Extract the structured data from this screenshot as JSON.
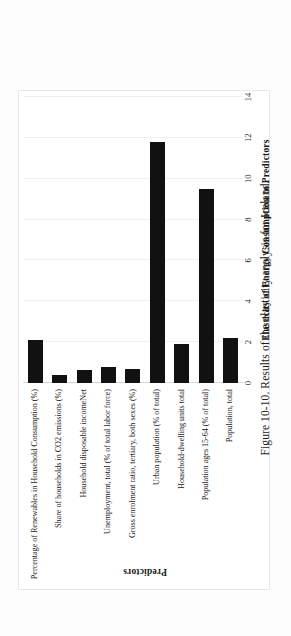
{
  "caption": "Figure 10-10. Results of the elasticity analysis for Iceland.",
  "chart_data": {
    "type": "bar",
    "orientation": "horizontal",
    "title": "",
    "xlabel": "Elasticity of Energy Consumption  to Predictors",
    "ylabel": "Predictors",
    "xlim": [
      0,
      14
    ],
    "xticks": [
      0,
      2,
      4,
      6,
      8,
      10,
      12,
      14
    ],
    "xtick_labels": [
      "0",
      "2",
      "4",
      "6",
      "8",
      "10",
      "12",
      "14"
    ],
    "grid": true,
    "legend": false,
    "bar_color": "#111111",
    "categories": [
      "Percentage of Renewables in Household Consumption (%)",
      "Share of households in CO2 emissions (%)",
      "Household disposable incomeNet",
      "Unemployment, total (% of total labor force)",
      "Gross enrolment ratio, tertiary, both sexes (%)",
      "Urban population (% of total)",
      "Household-dwelling units total",
      "Population ages 15-64 (% of total)",
      "Population, total"
    ],
    "values": [
      2.1,
      0.4,
      0.65,
      0.8,
      0.7,
      11.8,
      1.9,
      9.5,
      2.2
    ]
  }
}
